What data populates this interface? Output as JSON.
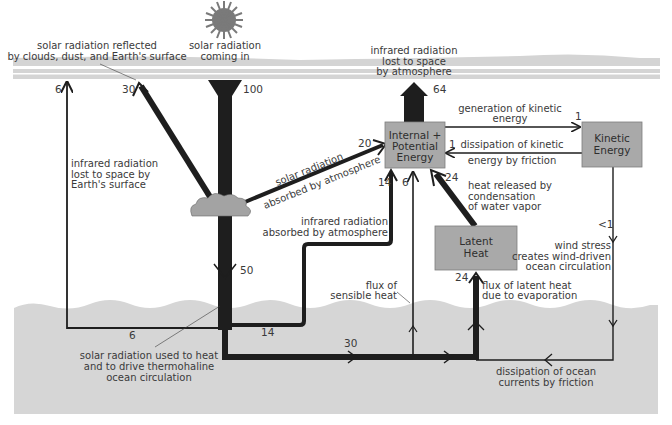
{
  "diagram": {
    "title": "",
    "colors": {
      "band": "#d4d4d4",
      "ocean": "#d6d6d6",
      "box": "#a9a9a9",
      "flow": "#1e1e1e",
      "sun": "#7a7a7a",
      "cloud": "#a3a3a3"
    },
    "nodes": {
      "internal_potential": {
        "label_line1": "Internal +",
        "label_line2": "Potential",
        "label_line3": "Energy"
      },
      "kinetic": {
        "label_line1": "Kinetic",
        "label_line2": "Energy"
      },
      "latent": {
        "label_line1": "Latent",
        "label_line2": "Heat"
      }
    },
    "labels": {
      "solar_in_1": "solar radiation",
      "solar_in_2": "coming in",
      "reflected_1": "solar radiation reflected",
      "reflected_2": "by clouds, dust, and Earth's surface",
      "ir_lost_atm_1": "infrared radiation",
      "ir_lost_atm_2": "lost to space",
      "ir_lost_atm_3": "by atmosphere",
      "ir_lost_surface_1": "infrared radiation",
      "ir_lost_surface_2": "lost to space by",
      "ir_lost_surface_3": "Earth's surface",
      "solar_absorbed_1": "solar radiation",
      "solar_absorbed_2": "absorbed by atmosphere",
      "ir_absorbed_1": "infrared radiation",
      "ir_absorbed_2": "absorbed by atmosphere",
      "gen_kinetic_1": "generation of kinetic",
      "gen_kinetic_2": "energy",
      "diss_kinetic_1": "dissipation of kinetic",
      "diss_kinetic_2": "energy by friction",
      "heat_released_1": "heat released by",
      "heat_released_2": "condensation",
      "heat_released_3": "of water vapor",
      "wind_stress_1": "wind stress",
      "wind_stress_2": "creates wind-driven",
      "wind_stress_3": "ocean circulation",
      "sensible_1": "flux of",
      "sensible_2": "sensible heat",
      "latent_flux_1": "flux of latent heat",
      "latent_flux_2": "due to evaporation",
      "solar_ocean_1": "solar radiation used to heat",
      "solar_ocean_2": "and to drive thermohaline",
      "solar_ocean_3": "ocean circulation",
      "ocean_diss_1": "dissipation of ocean",
      "ocean_diss_2": "currents by friction"
    },
    "values": {
      "solar_in": "100",
      "reflected": "30",
      "ir_surface_lost": "6",
      "ir_atm_lost": "64",
      "solar_absorbed_atm": "20",
      "to_surface": "50",
      "surface_ir_out": "6",
      "ir_absorbed_atm": "14",
      "sensible": "6",
      "latent_release": "24",
      "latent_evap": "24",
      "gen_kinetic": "1",
      "diss_kinetic": "1",
      "wind_stress": "<1",
      "ocean_store": "30",
      "surface_ir_branch": "14"
    }
  }
}
